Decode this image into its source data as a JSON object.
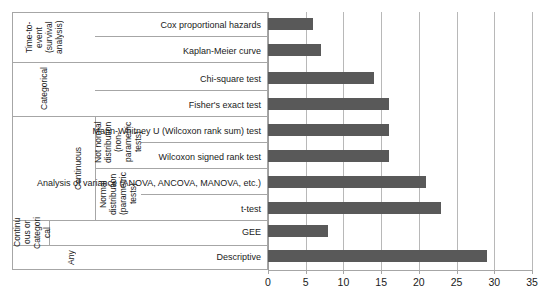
{
  "chart_data": {
    "type": "bar",
    "orientation": "horizontal",
    "title": "",
    "xlabel": "",
    "ylabel": "",
    "xlim": [
      0,
      35
    ],
    "xticks": [
      0,
      5,
      10,
      15,
      20,
      25,
      30,
      35
    ],
    "grid": "vertical",
    "legend": "none",
    "bar_color": "#595959",
    "categories": [
      "Cox proportional hazards",
      "Kaplan-Meier curve",
      "Chi-square test",
      "Fisher's exact test",
      "Mann-Whitney U (Wilcoxon rank sum) test",
      "Wilcoxon signed rank test",
      "Analysis of variance (ANOVA, ANCOVA, MANOVA, etc.)",
      "t-test",
      "GEE",
      "Descriptive"
    ],
    "values": [
      6,
      7,
      14,
      16,
      16,
      16,
      21,
      23,
      8,
      29
    ],
    "group_labels": [
      "Time-to-event (survival analysis)",
      "Categorical",
      "Not normal distribution (non-parametric tests)",
      "Normal distribution (parametric tests)",
      "Continuous",
      "Continuous or Categorical",
      "Any"
    ]
  },
  "axis": {
    "ticks": [
      {
        "label": "0"
      },
      {
        "label": "5"
      },
      {
        "label": "10"
      },
      {
        "label": "15"
      },
      {
        "label": "20"
      },
      {
        "label": "25"
      },
      {
        "label": "30"
      },
      {
        "label": "35"
      }
    ]
  },
  "rows": [
    {
      "name": "Cox proportional hazards",
      "value": 6
    },
    {
      "name": "Kaplan-Meier curve",
      "value": 7
    },
    {
      "name": "Chi-square test",
      "value": 14
    },
    {
      "name": "Fisher's exact test",
      "value": 16
    },
    {
      "name": "Mann-Whitney U (Wilcoxon rank sum) test",
      "value": 16
    },
    {
      "name": "Wilcoxon signed rank test",
      "value": 16
    },
    {
      "name": "Analysis of variance (ANOVA, ANCOVA, MANOVA, etc.)",
      "value": 21
    },
    {
      "name": "t-test",
      "value": 23
    },
    {
      "name": "GEE",
      "value": 8
    },
    {
      "name": "Descriptive",
      "value": 29
    }
  ],
  "groups": {
    "time_to_event": "Time-to-event\n(survival\nanalysis)",
    "categorical": "Categorical",
    "not_normal": "Not normal\ndistribution\n(non-parametric\ntests)",
    "normal": "Normal\ndistribution\n(parametric\ntests)",
    "continuous": "Continuous",
    "cont_or_cat": "Continu\nous or\nCategori\ncal",
    "any": "Any"
  },
  "title_strip": {
    "text": ""
  }
}
